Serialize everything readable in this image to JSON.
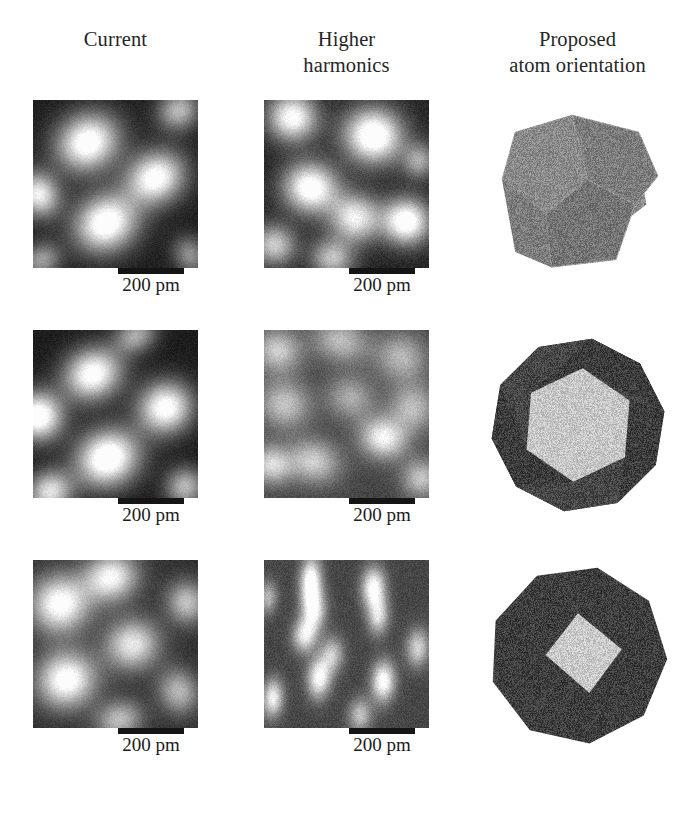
{
  "figure": {
    "background_color": "#ffffff",
    "columns": [
      {
        "id": "current",
        "title_lines": [
          "Current"
        ]
      },
      {
        "id": "higher-harmonics",
        "title_lines": [
          "Higher",
          "harmonics"
        ]
      },
      {
        "id": "proposed-atom-orientation",
        "title_lines": [
          "Proposed",
          "atom orientation"
        ]
      }
    ],
    "scalebar": {
      "label": "200 pm",
      "bar_color": "#151515"
    },
    "rows": [
      {
        "id": "row-1",
        "current": {
          "panel_label": "STM current image row 1",
          "blob_count": 4,
          "contrast": "high",
          "mean_gray": "#6a6a6a"
        },
        "higher_harmonics": {
          "panel_label": "Higher harmonics image row 1",
          "blob_count": 6,
          "contrast": "high",
          "mean_gray": "#707070"
        },
        "polyhedron": {
          "panel_label": "Proposed atom orientation row 1",
          "shape": "dodecahedron",
          "orientation": "vertex-on, three pentagonal faces visible",
          "face_colors": [
            "#8a8a8a",
            "#7c7c7c",
            "#747474"
          ],
          "edge_color": "#9a9a9a"
        }
      },
      {
        "id": "row-2",
        "current": {
          "panel_label": "STM current image row 2",
          "blob_count": 4,
          "contrast": "high",
          "mean_gray": "#6d6d6d"
        },
        "higher_harmonics": {
          "panel_label": "Higher harmonics image row 2",
          "blob_count": 7,
          "contrast": "medium",
          "mean_gray": "#787878"
        },
        "polyhedron": {
          "panel_label": "Proposed atom orientation row 2",
          "shape": "dodecahedron",
          "orientation": "face-on, bright central pentagon with dark surrounding faces",
          "face_colors": [
            "#c6c6c6",
            "#3c3c3c",
            "#474747"
          ],
          "edge_color": "#5a5a5a"
        }
      },
      {
        "id": "row-3",
        "current": {
          "panel_label": "STM current image row 3",
          "blob_count": 5,
          "contrast": "medium",
          "mean_gray": "#757575"
        },
        "higher_harmonics": {
          "panel_label": "Higher harmonics image row 3",
          "blob_count": 9,
          "contrast": "high",
          "mean_gray": "#808080"
        },
        "polyhedron": {
          "panel_label": "Proposed atom orientation row 3",
          "shape": "dodecahedron",
          "orientation": "edge-on, small bright rhombic facet near centre",
          "face_colors": [
            "#3e3e3e",
            "#c9c9c9",
            "#464646"
          ],
          "edge_color": "#585858"
        }
      }
    ]
  }
}
